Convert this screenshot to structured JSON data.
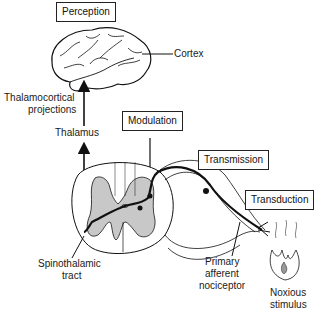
{
  "diagram": {
    "title_boxes": {
      "perception": "Perception",
      "modulation": "Modulation",
      "transmission": "Transmission",
      "transduction": "Transduction"
    },
    "labels": {
      "cortex": "Cortex",
      "thalamocortical_line1": "Thalamocortical",
      "thalamocortical_line2": "projections",
      "thalamus": "Thalamus",
      "spinothalamic_line1": "Spinothalamic",
      "spinothalamic_line2": "tract",
      "primary_line1": "Primary",
      "primary_line2": "afferent",
      "primary_line3": "nociceptor",
      "noxious_line1": "Noxious",
      "noxious_line2": "stimulus"
    },
    "colors": {
      "line": "#111111",
      "gray_matter": "#c8c8c8"
    }
  }
}
